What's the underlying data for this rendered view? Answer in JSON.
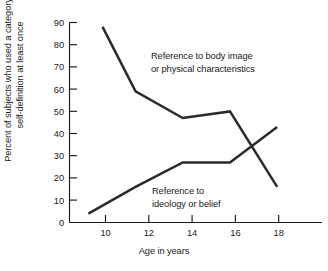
{
  "chart_data": {
    "type": "line",
    "title": "",
    "xlabel": "Age in years",
    "ylabel": "Percent of subjects who used a category of\nself-definition at least once",
    "x": [
      10,
      11,
      12,
      14,
      16,
      18
    ],
    "xlim": [
      9.2,
      19.9
    ],
    "ylim": [
      0,
      90
    ],
    "xticks": [
      10,
      12,
      14,
      16,
      18
    ],
    "xtick_labels": [
      "10",
      "12",
      "14",
      "16",
      "18"
    ],
    "yticks": [
      0,
      10,
      20,
      30,
      40,
      50,
      60,
      70,
      80,
      90
    ],
    "ytick_labels": [
      "0",
      "10",
      "20",
      "30",
      "40",
      "50",
      "60",
      "70",
      "80",
      "90"
    ],
    "grid": false,
    "legend_position": "inline-annotations",
    "series": [
      {
        "name": "Reference to body image or physical characteristics",
        "annotation": "Reference to body image\nor physical characteristics",
        "x": [
          10.6,
          12,
          14,
          16,
          18
        ],
        "values": [
          88,
          59,
          47,
          50,
          16
        ],
        "color": "#2b2b2b"
      },
      {
        "name": "Reference to ideology or belief",
        "annotation": "Reference to\nideology or belief",
        "x": [
          10,
          12,
          14,
          16,
          18
        ],
        "values": [
          4,
          16,
          27,
          27,
          43
        ],
        "color": "#2b2b2b"
      }
    ],
    "annotations": [
      {
        "id": "body-image-annotation",
        "lines": [
          "Reference to body image",
          "or physical characteristics"
        ]
      },
      {
        "id": "ideology-annotation",
        "lines": [
          "Reference to",
          "ideology or belief"
        ]
      }
    ]
  }
}
